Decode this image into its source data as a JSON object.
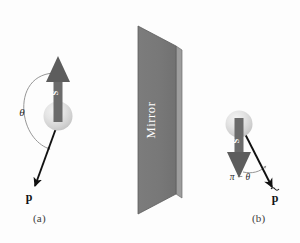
{
  "figure": {
    "kind": "physics-diagram",
    "colors": {
      "background": "#fdfdfd",
      "mirror_face": "#7a7a7a",
      "mirror_edge": "#9d9d9d",
      "mirror_outline": "#5d5d5d",
      "spin_arrow": "#5d5d5d",
      "spin_arrow_shaft": "#6b6b6b",
      "sphere_light": "#ededed",
      "sphere_mid": "#dcdcdc",
      "sphere_dark": "#c8c8c8",
      "momentum_arrow": "#111111",
      "arc": "#8a8a8a",
      "label_text": "#2b2b2b",
      "spin_label_text": "#ffffff",
      "mirror_label_text": "#ffffff"
    }
  },
  "mirror": {
    "label": "Mirror",
    "name": "mirror-surface"
  },
  "panel_a": {
    "caption": "(a)",
    "spin_label": "S",
    "momentum_label": "p",
    "angle_label": "θ"
  },
  "panel_b": {
    "caption": "(b)",
    "spin_label": "S",
    "momentum_label": "p̃",
    "momentum_label_base": "p",
    "angle_label": "π − θ"
  }
}
